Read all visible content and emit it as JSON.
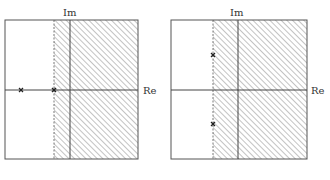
{
  "diagrams": [
    {
      "name": "left-s-plane",
      "axis_labels": {
        "imaginary": "Im",
        "real": "Re"
      },
      "region": "shaded right of dashed boundary",
      "poles": [
        {
          "description": "pole on real axis, far left"
        },
        {
          "description": "pole on real axis, on boundary"
        }
      ]
    },
    {
      "name": "right-s-plane",
      "axis_labels": {
        "imaginary": "Im",
        "real": "Re"
      },
      "region": "shaded right of dashed boundary",
      "poles": [
        {
          "description": "complex pole, upper half, on boundary"
        },
        {
          "description": "complex pole, lower half, on boundary"
        }
      ]
    }
  ],
  "colors": {
    "line": "#444444",
    "hatch": "#888888",
    "background": "#ffffff"
  }
}
